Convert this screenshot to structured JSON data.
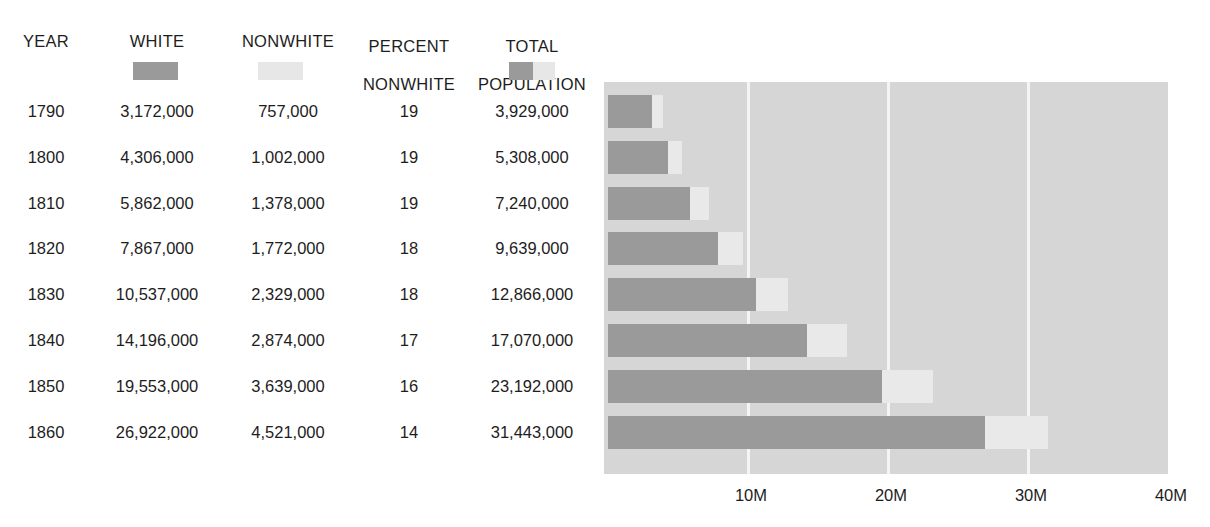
{
  "table": {
    "columns": [
      {
        "key": "year",
        "label": "YEAR"
      },
      {
        "key": "white",
        "label": "WHITE"
      },
      {
        "key": "nonwhite",
        "label": "NONWHITE"
      },
      {
        "key": "percent_nonwhite",
        "label_line1": "PERCENT",
        "label_line2": "NONWHITE"
      },
      {
        "key": "total_population",
        "label_line1": "TOTAL",
        "label_line2": "POPULATION"
      }
    ],
    "legend": {
      "white_swatch": "white-legend-swatch",
      "nonwhite_swatch": "nonwhite-legend-swatch",
      "total_swatch": "total-population-legend-swatch"
    },
    "rows": [
      {
        "year": "1790",
        "white": "3,172,000",
        "nonwhite": "757,000",
        "percent_nonwhite": "19",
        "total_population": "3,929,000"
      },
      {
        "year": "1800",
        "white": "4,306,000",
        "nonwhite": "1,002,000",
        "percent_nonwhite": "19",
        "total_population": "5,308,000"
      },
      {
        "year": "1810",
        "white": "5,862,000",
        "nonwhite": "1,378,000",
        "percent_nonwhite": "19",
        "total_population": "7,240,000"
      },
      {
        "year": "1820",
        "white": "7,867,000",
        "nonwhite": "1,772,000",
        "percent_nonwhite": "18",
        "total_population": "9,639,000"
      },
      {
        "year": "1830",
        "white": "10,537,000",
        "nonwhite": "2,329,000",
        "percent_nonwhite": "18",
        "total_population": "12,866,000"
      },
      {
        "year": "1840",
        "white": "14,196,000",
        "nonwhite": "2,874,000",
        "percent_nonwhite": "17",
        "total_population": "17,070,000"
      },
      {
        "year": "1850",
        "white": "19,553,000",
        "nonwhite": "3,639,000",
        "percent_nonwhite": "16",
        "total_population": "23,192,000"
      },
      {
        "year": "1860",
        "white": "26,922,000",
        "nonwhite": "4,521,000",
        "percent_nonwhite": "14",
        "total_population": "31,443,000"
      }
    ]
  },
  "chart_data": {
    "type": "bar",
    "orientation": "horizontal",
    "stacked": true,
    "title": "",
    "xlabel": "",
    "ylabel": "",
    "categories": [
      "1790",
      "1800",
      "1810",
      "1820",
      "1830",
      "1840",
      "1850",
      "1860"
    ],
    "series": [
      {
        "name": "WHITE",
        "color": "#9a9a9a",
        "values": [
          3172000,
          4306000,
          5862000,
          7867000,
          10537000,
          14196000,
          19553000,
          26922000
        ]
      },
      {
        "name": "NONWHITE",
        "color": "#e9e9e9",
        "values": [
          757000,
          1002000,
          1378000,
          1772000,
          2329000,
          2874000,
          3639000,
          4521000
        ]
      }
    ],
    "totals": [
      3929000,
      5308000,
      7240000,
      9639000,
      12866000,
      17070000,
      23192000,
      31443000
    ],
    "xlim": [
      0,
      40000000
    ],
    "xticks": [
      10000000,
      20000000,
      30000000,
      40000000
    ],
    "xtick_labels": [
      "10M",
      "20M",
      "30M",
      "40M"
    ],
    "grid": true,
    "grid_color": "#f4f4f4",
    "plot_background": "#d6d6d6",
    "legend_position": "table-header"
  },
  "colors": {
    "white_series": "#9a9a9a",
    "nonwhite_series": "#e9e9e9",
    "plot_bg": "#d6d6d6",
    "gridline": "#f4f4f4",
    "text": "#1d1d1d"
  }
}
